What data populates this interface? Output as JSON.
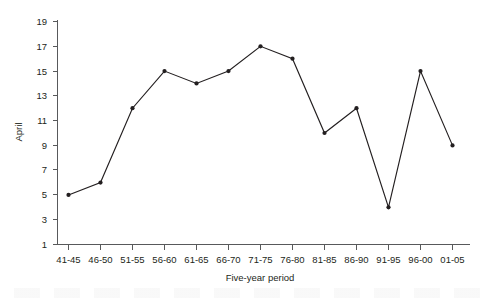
{
  "chart_data": {
    "type": "line",
    "title": "",
    "xlabel": "Five-year period",
    "ylabel": "April",
    "categories": [
      "41-45",
      "46-50",
      "51-55",
      "56-60",
      "61-65",
      "66-70",
      "71-75",
      "76-80",
      "81-85",
      "86-90",
      "91-95",
      "96-00",
      "01-05"
    ],
    "values": [
      5,
      6,
      12,
      15,
      14,
      15,
      17,
      16,
      10,
      12,
      4,
      15,
      9
    ],
    "series": [
      {
        "name": "April",
        "values": [
          5,
          6,
          12,
          15,
          14,
          15,
          17,
          16,
          10,
          12,
          4,
          15,
          9
        ]
      }
    ],
    "yticks": [
      1,
      3,
      5,
      7,
      9,
      11,
      13,
      15,
      17,
      19
    ],
    "ytick_labels": [
      "1",
      "3",
      "5",
      "7",
      "9",
      "11",
      "13",
      "15",
      "17",
      "19"
    ],
    "ylim": [
      1,
      19
    ],
    "grid": false,
    "legend": false,
    "legend_position": "none",
    "marker": "filled-circle",
    "line_color": "#231f20",
    "marker_color": "#231f20",
    "axis_color": "#58595b",
    "background_color": "#ffffff"
  }
}
